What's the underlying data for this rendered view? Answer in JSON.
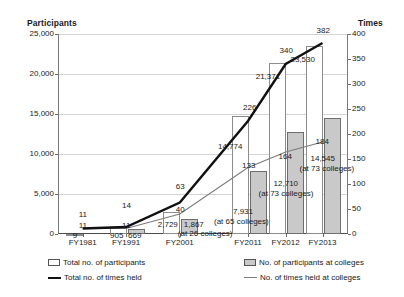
{
  "axes": {
    "left_title": "Participants",
    "right_title": "Times",
    "left_ticks": [
      "0",
      "5,000",
      "10,000",
      "15,000",
      "20,000",
      "25,000"
    ],
    "right_ticks": [
      "0",
      "50",
      "100",
      "150",
      "200",
      "250",
      "300",
      "350",
      "400"
    ]
  },
  "legend": {
    "total_participants": "Total no. of participants",
    "total_times_held": "Total no. of times held",
    "participants_at_colleges": "No. of participants at colleges",
    "times_held_at_colleges": "No. of times held at colleges"
  },
  "labels": {
    "total_participants": [
      "9",
      "905",
      "2,729",
      "14,774",
      "21,371",
      "23,530"
    ],
    "participants_at_colleges": [
      "",
      "669",
      "1,867",
      "7,931",
      "12,710",
      "14,545"
    ],
    "total_times_held": [
      "11",
      "14",
      "63",
      "226",
      "340",
      "382"
    ],
    "times_held_at_colleges": [
      "11",
      "11",
      "40",
      "133",
      "164",
      "184"
    ],
    "college_counts": [
      "",
      "",
      "(at 26 colleges)",
      "(at 65 colleges)",
      "(at 73 colleges)",
      "(at 73 colleges)"
    ]
  },
  "colors": {
    "bar_total_fill": "#ffffff",
    "bar_total_stroke": "#8c8c8c",
    "bar_college_fill": "#c9c9c9",
    "bar_college_stroke": "#6e6e6e",
    "line_total": "#111111",
    "line_college": "#7d7d7d",
    "grid": "#d4d4d4"
  },
  "chart_data": {
    "type": "bar",
    "title": "",
    "subtitle": "",
    "xlabel": "",
    "ylabel": "Participants",
    "y2label": "Times",
    "categories": [
      "FY1981",
      "FY1991",
      "FY2001",
      "FY2011",
      "FY2012",
      "FY2013"
    ],
    "ylim": [
      0,
      25000
    ],
    "y2lim": [
      0,
      400
    ],
    "ytick_values": [
      0,
      5000,
      10000,
      15000,
      20000,
      25000
    ],
    "y2tick_values": [
      0,
      50,
      100,
      150,
      200,
      250,
      300,
      350,
      400
    ],
    "grid": true,
    "legend_position": "bottom",
    "series": [
      {
        "name": "Total no. of participants",
        "chart_type": "bar",
        "axis": "left",
        "values": [
          9,
          905,
          2729,
          14774,
          21371,
          23530
        ]
      },
      {
        "name": "No. of participants at colleges",
        "chart_type": "bar",
        "axis": "left",
        "values": [
          null,
          669,
          1867,
          7931,
          12710,
          14545
        ]
      },
      {
        "name": "Total no. of times held",
        "chart_type": "line",
        "axis": "right",
        "values": [
          11,
          14,
          63,
          226,
          340,
          382
        ]
      },
      {
        "name": "No. of times held at colleges",
        "chart_type": "line",
        "axis": "right",
        "values": [
          11,
          11,
          40,
          133,
          164,
          184
        ]
      }
    ],
    "annotations": [
      {
        "category": "FY2001",
        "text": "(at 26 colleges)"
      },
      {
        "category": "FY2011",
        "text": "(at 65 colleges)"
      },
      {
        "category": "FY2012",
        "text": "(at 73 colleges)"
      },
      {
        "category": "FY2013",
        "text": "(at 73 colleges)"
      }
    ]
  }
}
